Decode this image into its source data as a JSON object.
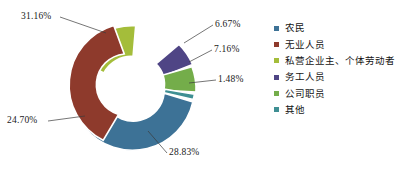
{
  "chart_data": {
    "type": "pie",
    "variant": "donut",
    "title": "",
    "subtitle": "",
    "xlabel": "",
    "ylabel": "",
    "grid": false,
    "legend_position": "right",
    "units": "percent",
    "hole_ratio": 0.5,
    "start_angle_deg": -86,
    "direction": "clockwise",
    "categories": [
      "农民",
      "无业人员",
      "私营企业主、个体劳动者",
      "务工人员",
      "公司职员",
      "其他"
    ],
    "values": [
      28.83,
      24.7,
      31.16,
      6.67,
      7.16,
      1.48
    ],
    "colors": [
      "#3d7296",
      "#8e3a2c",
      "#a4bd3a",
      "#4f4585",
      "#74ad4a",
      "#3f8f93"
    ],
    "data_labels": [
      "28.83%",
      "24.70%",
      "31.16%",
      "6.67%",
      "7.16%",
      "1.48%"
    ],
    "draw_order": [
      "私营企业主、个体劳动者",
      "务工人员",
      "公司职员",
      "其他",
      "农民",
      "无业人员"
    ],
    "slices": [
      {
        "label": "私营企业主、个体劳动者",
        "value": 31.16,
        "data_label": "31.16%",
        "color": "#a4bd3a"
      },
      {
        "label": "务工人员",
        "value": 6.67,
        "data_label": "6.67%",
        "color": "#4f4585"
      },
      {
        "label": "公司职员",
        "value": 7.16,
        "data_label": "7.16%",
        "color": "#74ad4a"
      },
      {
        "label": "其他",
        "value": 1.48,
        "data_label": "1.48%",
        "color": "#3f8f93"
      },
      {
        "label": "农民",
        "value": 28.83,
        "data_label": "28.83%",
        "color": "#3d7296"
      },
      {
        "label": "无业人员",
        "value": 24.7,
        "data_label": "24.70%",
        "color": "#8e3a2c"
      }
    ]
  },
  "labels": {
    "pct_31": "31.16%",
    "pct_24": "24.70%",
    "pct_28": "28.83%",
    "pct_6": "6.67%",
    "pct_7": "7.16%",
    "pct_1": "1.48%"
  },
  "legend": {
    "items": [
      {
        "label": "农民",
        "color": "#3d7296"
      },
      {
        "label": "无业人员",
        "color": "#8e3a2c"
      },
      {
        "label": "私营企业主、个体劳动者",
        "color": "#a4bd3a"
      },
      {
        "label": "务工人员",
        "color": "#4f4585"
      },
      {
        "label": "公司职员",
        "color": "#74ad4a"
      },
      {
        "label": "其他",
        "color": "#3f8f93"
      }
    ]
  }
}
